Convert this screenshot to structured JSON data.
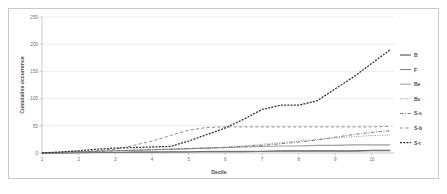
{
  "chart_data": {
    "type": "line",
    "title": "",
    "xlabel": "Decile",
    "ylabel": "Cumulative occurrence",
    "xlim": [
      1,
      10.6
    ],
    "ylim": [
      0,
      250
    ],
    "xticks": [
      "1",
      "2",
      "3",
      "4",
      "5",
      "6",
      "7",
      "8",
      "9",
      "10"
    ],
    "yticks": [
      "0",
      "50",
      "100",
      "150",
      "200",
      "250"
    ],
    "grid": "horizontal",
    "legend_position": "right",
    "x": [
      1,
      1.5,
      2,
      2.5,
      3,
      3.5,
      4,
      4.5,
      5,
      5.5,
      6,
      6.5,
      7,
      7.5,
      8,
      8.5,
      9,
      9.5,
      10,
      10.5
    ],
    "series": [
      {
        "name": "B",
        "label": "B",
        "color": "#3d3d3d",
        "dash": "solid",
        "width": 0.9,
        "values": [
          0,
          0,
          1,
          1,
          1,
          2,
          2,
          2,
          2,
          3,
          3,
          3,
          3,
          4,
          4,
          4,
          4,
          4,
          5,
          5
        ]
      },
      {
        "name": "F",
        "label": "F",
        "color": "#7a7a7a",
        "dash": "solid",
        "width": 0.9,
        "values": [
          0,
          0,
          0,
          1,
          1,
          1,
          1,
          2,
          2,
          2,
          2,
          2,
          3,
          3,
          3,
          3,
          3,
          3,
          4,
          4
        ]
      },
      {
        "name": "Be",
        "label": "Be",
        "color": "#9e9e9e",
        "dash": "solid",
        "width": 1.1,
        "values": [
          0,
          1,
          2,
          3,
          4,
          5,
          6,
          7,
          8,
          9,
          10,
          11,
          12,
          13,
          13,
          14,
          14,
          15,
          15,
          15
        ]
      },
      {
        "name": "Bs",
        "label": "Bs",
        "color": "#8c8c8c",
        "dash": "dotted",
        "width": 1.0,
        "values": [
          0,
          1,
          2,
          3,
          4,
          5,
          6,
          7,
          8,
          9,
          11,
          13,
          16,
          19,
          22,
          25,
          28,
          30,
          32,
          33
        ]
      },
      {
        "name": "S-s",
        "label": "S-s",
        "color": "#777777",
        "dash": "dashdot",
        "width": 1.0,
        "values": [
          0,
          1,
          2,
          3,
          4,
          5,
          6,
          7,
          8,
          9,
          10,
          12,
          14,
          17,
          20,
          24,
          29,
          34,
          38,
          41
        ]
      },
      {
        "name": "S-b",
        "label": "S-b",
        "color": "#8f8f8f",
        "dash": "dashed",
        "width": 1.0,
        "values": [
          0,
          1,
          2,
          4,
          7,
          14,
          22,
          32,
          42,
          47,
          48,
          48,
          48,
          48,
          48,
          48,
          48,
          48,
          48,
          49
        ]
      },
      {
        "name": "S-t",
        "label": "S-t",
        "color": "#2e2e2e",
        "dash": "finedash",
        "width": 1.3,
        "values": [
          0,
          2,
          4,
          7,
          9,
          10,
          11,
          12,
          22,
          34,
          46,
          62,
          80,
          88,
          88,
          96,
          118,
          140,
          165,
          190
        ]
      }
    ]
  }
}
